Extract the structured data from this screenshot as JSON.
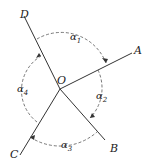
{
  "diagram": {
    "type": "angles-around-point",
    "center": {
      "label": "O",
      "x": 60,
      "y": 89
    },
    "rays": [
      {
        "label": "D",
        "end": [
          24,
          16
        ],
        "label_pos": [
          20,
          18
        ]
      },
      {
        "label": "A",
        "end": [
          132,
          53
        ],
        "label_pos": [
          134,
          54
        ]
      },
      {
        "label": "B",
        "end": [
          105,
          140
        ],
        "label_pos": [
          110,
          152
        ]
      },
      {
        "label": "C",
        "end": [
          20,
          155
        ],
        "label_pos": [
          10,
          158
        ]
      }
    ],
    "angles": [
      {
        "label": "α",
        "sub": "1",
        "between": [
          "D",
          "A"
        ],
        "label_pos": [
          70,
          40
        ]
      },
      {
        "label": "α",
        "sub": "2",
        "between": [
          "A",
          "B"
        ],
        "label_pos": [
          96,
          99
        ]
      },
      {
        "label": "α",
        "sub": "3",
        "between": [
          "B",
          "C"
        ],
        "label_pos": [
          61,
          148
        ]
      },
      {
        "label": "α",
        "sub": "4",
        "between": [
          "C",
          "D"
        ],
        "label_pos": [
          17,
          92
        ]
      }
    ],
    "colors": {
      "line": "#333333",
      "arc": "#555555",
      "text": "#222222"
    }
  }
}
